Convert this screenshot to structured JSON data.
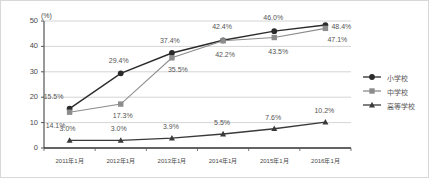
{
  "chart_data": {
    "type": "line",
    "title": "",
    "xlabel": "",
    "ylabel": "(%)",
    "ylim": [
      0,
      50
    ],
    "yticks": [
      0,
      10,
      20,
      30,
      40,
      50
    ],
    "grid": true,
    "legend_position": "right",
    "categories": [
      "2011年1月",
      "2012年1月",
      "2013年1月",
      "2014年1月",
      "2015年1月",
      "2016年1月"
    ],
    "series": [
      {
        "name": "小学校",
        "marker": "circle",
        "color": "#2b2b2b",
        "values": [
          15.5,
          29.4,
          37.4,
          42.4,
          46.0,
          48.4
        ],
        "labels": [
          "15.5%",
          "29.4%",
          "37.4%",
          "42.4%",
          "46.0%",
          "48.4%"
        ]
      },
      {
        "name": "中学校",
        "marker": "square",
        "color": "#8c8c8c",
        "values": [
          14.1,
          17.3,
          35.5,
          42.2,
          43.5,
          47.1
        ],
        "labels": [
          "14.1%",
          "17.3%",
          "35.5%",
          "42.2%",
          "43.5%",
          "47.1%"
        ]
      },
      {
        "name": "高等学校",
        "marker": "triangle",
        "color": "#3a3a3a",
        "values": [
          3.0,
          3.0,
          3.9,
          5.5,
          7.6,
          10.2
        ],
        "labels": [
          "3.0%",
          "3.0%",
          "3.9%",
          "5.5%",
          "7.6%",
          "10.2%"
        ]
      }
    ]
  },
  "axis": {
    "unit": "(%)",
    "yticks": [
      "0",
      "10",
      "20",
      "30",
      "40",
      "50"
    ],
    "xticks": [
      "2011年1月",
      "2012年1月",
      "2013年1月",
      "2014年1月",
      "2015年1月",
      "2016年1月"
    ]
  },
  "legend": {
    "items": [
      {
        "label": "小学校"
      },
      {
        "label": "中学校"
      },
      {
        "label": "高等学校"
      }
    ]
  },
  "labels": {
    "s0": [
      "15.5%",
      "29.4%",
      "37.4%",
      "42.4%",
      "46.0%",
      "48.4%"
    ],
    "s1": [
      "14.1%",
      "17.3%",
      "35.5%",
      "42.2%",
      "43.5%",
      "47.1%"
    ],
    "s2": [
      "3.0%",
      "3.0%",
      "3.9%",
      "5.5%",
      "7.6%",
      "10.2%"
    ]
  },
  "colors": {
    "series_a": "#2b2b2b",
    "series_b": "#8c8c8c",
    "series_c": "#3a3a3a",
    "grid": "#c9c9c9",
    "axis": "#555555",
    "text": "#4a4a4a",
    "background": "#ffffff"
  }
}
